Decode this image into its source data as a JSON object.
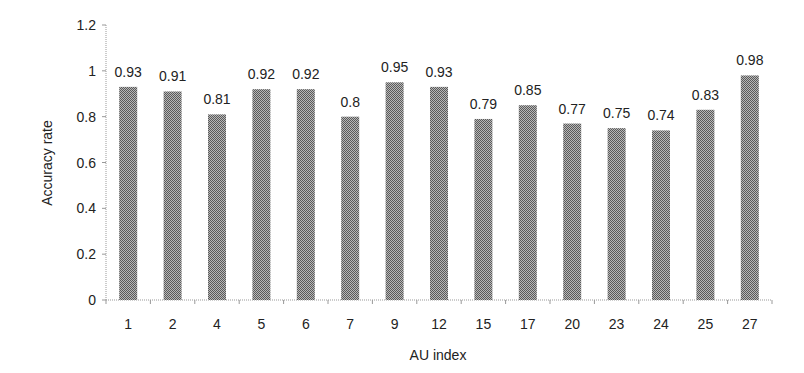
{
  "chart_data": {
    "type": "bar",
    "title": "",
    "xlabel": "AU index",
    "ylabel": "Accuracy rate",
    "categories": [
      "1",
      "2",
      "4",
      "5",
      "6",
      "7",
      "9",
      "12",
      "15",
      "17",
      "20",
      "23",
      "24",
      "25",
      "27"
    ],
    "values": [
      0.93,
      0.91,
      0.81,
      0.92,
      0.92,
      0.8,
      0.95,
      0.93,
      0.79,
      0.85,
      0.77,
      0.75,
      0.74,
      0.83,
      0.98
    ],
    "data_labels": [
      "0.93",
      "0.91",
      "0.81",
      "0.92",
      "0.92",
      "0.8",
      "0.95",
      "0.93",
      "0.79",
      "0.85",
      "0.77",
      "0.75",
      "0.74",
      "0.83",
      "0.98"
    ],
    "ylim": [
      0,
      1.2
    ],
    "yticks": [
      0,
      0.2,
      0.4,
      0.6,
      0.8,
      1,
      1.2
    ],
    "ytick_labels": [
      "0",
      "0.2",
      "0.4",
      "0.6",
      "0.8",
      "1",
      "1.2"
    ],
    "grid": false,
    "legend": null,
    "bar_fill": "#8a8a8a",
    "bar_pattern": "checker-dither"
  }
}
